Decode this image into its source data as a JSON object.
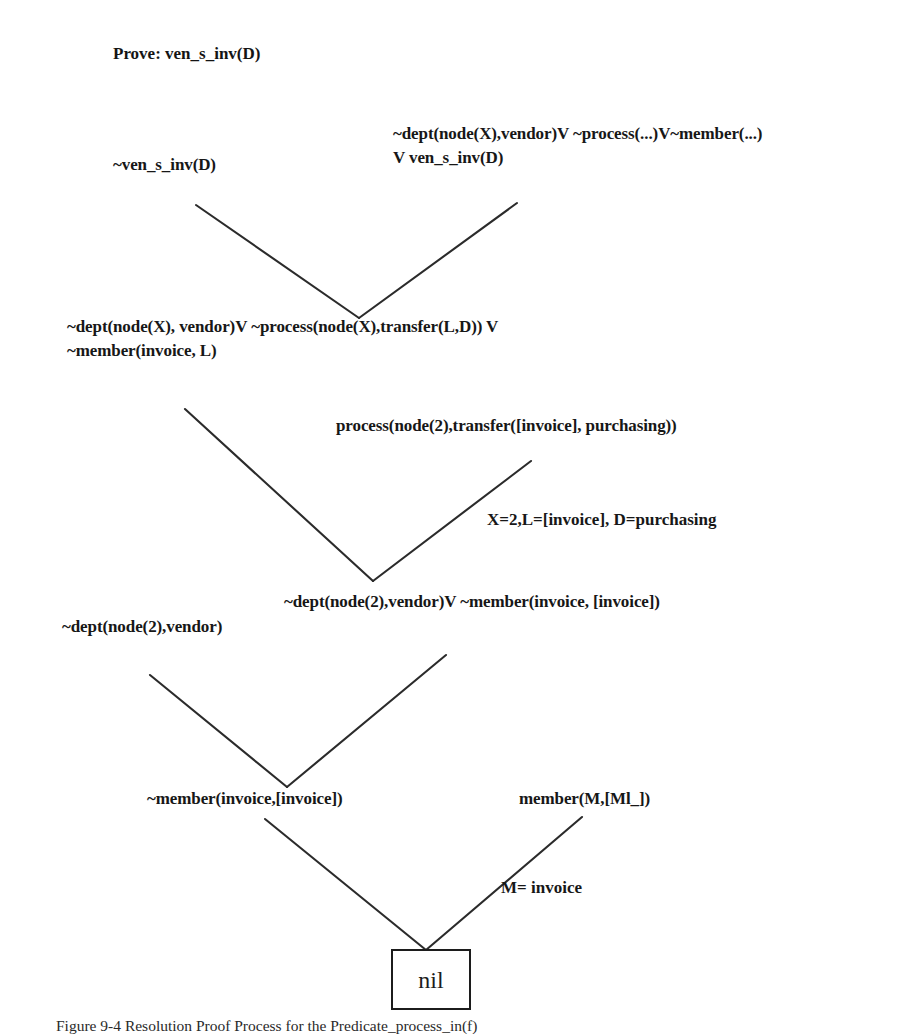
{
  "figure": {
    "goal_label": "Prove: ven_s_inv(D)",
    "caption": "Figure 9-4 Resolution Proof Process for the Predicate_process_in(f)",
    "nil_node": "nil",
    "line_color": "#2b2b2b",
    "text_color": "#171717",
    "background": "#ffffff"
  },
  "nodes": [
    {
      "id": "negated-goal",
      "lines": [
        "~ven_s_inv(D)"
      ],
      "x": 113,
      "y": 153
    },
    {
      "id": "rule-clause-1",
      "lines": [
        "~dept(node(X),vendor)V ~process(...)V~member(...)",
        "V ven_s_inv(D)"
      ],
      "x": 393,
      "y": 122
    },
    {
      "id": "resolvent-1",
      "lines": [
        "~dept(node(X), vendor)V ~process(node(X),transfer(L,D)) V",
        "~member(invoice, L)"
      ],
      "x": 67,
      "y": 315
    },
    {
      "id": "fact-process",
      "lines": [
        "process(node(2),transfer([invoice], purchasing))"
      ],
      "x": 336,
      "y": 414
    },
    {
      "id": "resolvent-2",
      "lines": [
        "~dept(node(2),vendor)V ~member(invoice, [invoice])"
      ],
      "x": 284,
      "y": 590
    },
    {
      "id": "fact-dept",
      "lines": [
        "~dept(node(2),vendor)"
      ],
      "x": 62,
      "y": 615
    },
    {
      "id": "resolvent-3",
      "lines": [
        "~member(invoice,[invoice])"
      ],
      "x": 147,
      "y": 787
    },
    {
      "id": "fact-member",
      "lines": [
        "member(M,[Ml_])"
      ],
      "x": 519,
      "y": 787
    }
  ],
  "unifiers": [
    {
      "id": "unifier-1",
      "text": "X=2,L=[invoice], D=purchasing",
      "x": 487,
      "y": 508
    },
    {
      "id": "unifier-2",
      "text": "M= invoice",
      "x": 501,
      "y": 876
    }
  ],
  "edges": [
    {
      "id": "edge-goal-left",
      "x1": 196,
      "y1": 205,
      "x2": 359,
      "y2": 318
    },
    {
      "id": "edge-goal-right",
      "x1": 517,
      "y1": 203,
      "x2": 359,
      "y2": 318
    },
    {
      "id": "edge-res1-left",
      "x1": 185,
      "y1": 409,
      "x2": 373,
      "y2": 581
    },
    {
      "id": "edge-res1-right",
      "x1": 531,
      "y1": 461,
      "x2": 373,
      "y2": 581
    },
    {
      "id": "edge-res2-left",
      "x1": 150,
      "y1": 675,
      "x2": 287,
      "y2": 787
    },
    {
      "id": "edge-res2-right",
      "x1": 446,
      "y1": 655,
      "x2": 287,
      "y2": 787
    },
    {
      "id": "edge-res3-left",
      "x1": 265,
      "y1": 819,
      "x2": 426,
      "y2": 950
    },
    {
      "id": "edge-res3-right",
      "x1": 582,
      "y1": 817,
      "x2": 426,
      "y2": 950
    }
  ]
}
